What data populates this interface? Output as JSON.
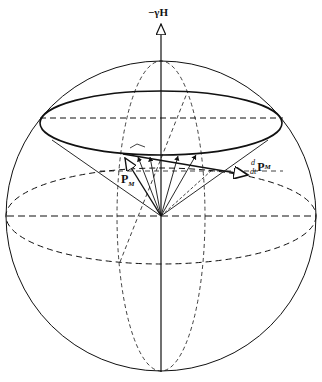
{
  "diagram": {
    "type": "Bloch sphere / precession of magnetization vector",
    "labels": {
      "field_axis": "−γH",
      "magnetization": "P",
      "magnetization_sub": "M",
      "derivative_num": "d",
      "derivative_den": "dt",
      "derivative_vec": "P",
      "derivative_sub": "M"
    },
    "colors": {
      "stroke": "#111111",
      "background": "#ffffff"
    }
  }
}
